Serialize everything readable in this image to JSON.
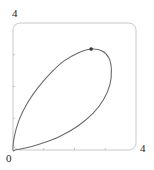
{
  "chart_data": {
    "type": "line",
    "title": "",
    "xlabel": "",
    "ylabel": "",
    "xlim": [
      0,
      4
    ],
    "ylim": [
      0,
      4
    ],
    "grid": false,
    "legend": null,
    "tick_labels": {
      "x_min": "0",
      "x_max": "4",
      "y_max": "4"
    },
    "minor_ticks": {
      "x": [
        1,
        2,
        3
      ],
      "y": [
        1,
        2,
        3
      ]
    },
    "series": [
      {
        "name": "closed curve",
        "closed": true,
        "points": [
          [
            0.0,
            0.0
          ],
          [
            0.05,
            0.45
          ],
          [
            0.2,
            0.95
          ],
          [
            0.45,
            1.45
          ],
          [
            0.8,
            1.95
          ],
          [
            1.2,
            2.4
          ],
          [
            1.65,
            2.8
          ],
          [
            2.1,
            3.05
          ],
          [
            2.54,
            3.18
          ],
          [
            2.9,
            3.12
          ],
          [
            3.12,
            2.9
          ],
          [
            3.2,
            2.52
          ],
          [
            3.15,
            2.05
          ],
          [
            2.95,
            1.6
          ],
          [
            2.6,
            1.15
          ],
          [
            2.1,
            0.75
          ],
          [
            1.5,
            0.42
          ],
          [
            0.9,
            0.2
          ],
          [
            0.4,
            0.06
          ],
          [
            0.1,
            0.01
          ],
          [
            0.0,
            0.0
          ]
        ]
      }
    ],
    "marked_point": {
      "x": 2.54,
      "y": 3.18
    },
    "colors": {
      "curve": "#6a6a6a",
      "frame": "#c8c8c8",
      "marker": "#333333"
    }
  }
}
